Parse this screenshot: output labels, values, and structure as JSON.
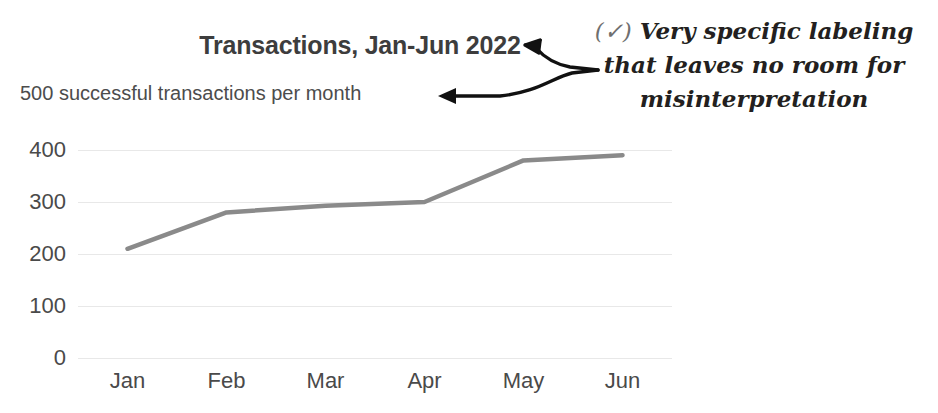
{
  "chart_data": {
    "type": "line",
    "title": "Transactions, Jan-Jun 2022",
    "subtitle": "500 successful transactions per month",
    "xlabel": "",
    "ylabel": "",
    "categories": [
      "Jan",
      "Feb",
      "Mar",
      "Apr",
      "May",
      "Jun"
    ],
    "values": [
      210,
      280,
      293,
      300,
      380,
      390
    ],
    "series": [
      {
        "name": "Successful transactions",
        "values": [
          210,
          280,
          293,
          300,
          380,
          390
        ],
        "color": "#8a8a8a"
      }
    ],
    "ylim": [
      0,
      400
    ],
    "yticks": [
      0,
      100,
      200,
      300,
      400
    ],
    "ytick_labels": [
      "0",
      "100",
      "200",
      "300",
      "400"
    ],
    "grid": true,
    "grid_axis": "y",
    "legend": false,
    "legend_position": "none"
  },
  "annotation": {
    "check_mark": "(✓)",
    "line1": "Very specific labeling",
    "line2": "that leaves no room for",
    "line3": "misinterpretation"
  },
  "colors": {
    "series_line": "#8a8a8a",
    "title_text": "#3d3d3d",
    "subtitle_text": "#4c4c4c",
    "tick_text": "#4a4a4a",
    "gridline": "#e8e8e8",
    "annotation_ink": "#231f20",
    "background": "#ffffff"
  }
}
